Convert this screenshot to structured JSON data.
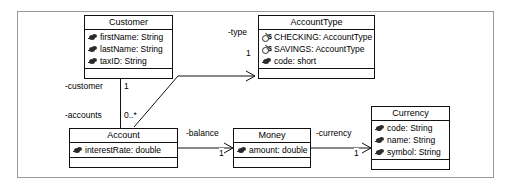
{
  "diagram": {
    "classes": [
      {
        "id": "customer",
        "name": "Customer",
        "attributes": [
          {
            "label": "firstName: String",
            "icon": "private-attribute-icon",
            "static": false
          },
          {
            "label": "lastName: String",
            "icon": "private-attribute-icon",
            "static": false
          },
          {
            "label": "taxID: String",
            "icon": "private-attribute-icon",
            "static": false
          }
        ],
        "operations": []
      },
      {
        "id": "accounttype",
        "name": "AccountType",
        "attributes": [
          {
            "label": "CHECKING: AccountType",
            "icon": "static-attribute-icon",
            "static": true
          },
          {
            "label": "SAVINGS: AccountType",
            "icon": "static-attribute-icon",
            "static": true
          },
          {
            "label": "code: short",
            "icon": "private-attribute-icon",
            "static": false
          }
        ],
        "operations": []
      },
      {
        "id": "account",
        "name": "Account",
        "attributes": [
          {
            "label": "interestRate: double",
            "icon": "private-attribute-icon",
            "static": false
          }
        ],
        "operations": []
      },
      {
        "id": "money",
        "name": "Money",
        "attributes": [
          {
            "label": "amount: double",
            "icon": "private-attribute-icon",
            "static": false
          }
        ],
        "operations": []
      },
      {
        "id": "currency",
        "name": "Currency",
        "attributes": [
          {
            "label": "code: String",
            "icon": "private-attribute-icon",
            "static": false
          },
          {
            "label": "name: String",
            "icon": "private-attribute-icon",
            "static": false
          },
          {
            "label": "symbol: String",
            "icon": "private-attribute-icon",
            "static": false
          }
        ],
        "operations": []
      }
    ],
    "associations": [
      {
        "id": "customer-account",
        "role_source": "-customer",
        "mult_source": "1",
        "role_target": "-accounts",
        "mult_target": "0..*"
      },
      {
        "id": "account-accounttype",
        "role": "-type",
        "mult": "1"
      },
      {
        "id": "account-money",
        "role": "-balance",
        "mult": "1"
      },
      {
        "id": "money-currency",
        "role": "-currency",
        "mult": "1"
      }
    ],
    "colors": {
      "line": "#111111",
      "frame": "#9a9a9a",
      "background": "#ffffff",
      "icon": "#2b2b2b"
    }
  }
}
